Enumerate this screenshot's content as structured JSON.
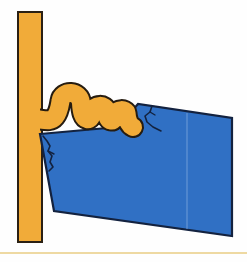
{
  "figure": {
    "colors": {
      "background": "#fefefe",
      "bar_fill": "#f1ab39",
      "bar_outline": "#2a2014",
      "ribbon_fill": "#f1ab39",
      "ribbon_outline": "#261c10",
      "block_fill": "#3070c4",
      "block_outline": "#13223f",
      "crack_color": "#13223f",
      "crease_color": "#7aa5dc",
      "divider_color": "#eed9a2"
    },
    "shapes": {
      "wall_bar": {
        "x": "18",
        "y": "12",
        "width": "24",
        "height": "230"
      },
      "tilted_block": {
        "points": "40,134 118,127 138,104 232,118 232,236 54,211"
      },
      "block_crease": {
        "x1": "187",
        "y1": "113",
        "x2": "187",
        "y2": "229"
      },
      "folded_ribbon": {
        "d": "M 36 119 C 45 120 51 122 55 117 C 59 112 59.5 107 60.5 101 C 62 90 80 90 81 103 C 81.5 112 83 118 87 119 C 90.5 120 91.5 116 92.5 112 C 93.5 104 106 104 106.5 111 C 107 117 108.5 120 111 120.5 C 114 121 114.5 118 115.5 114 C 116.5 109 126 109 126.5 113 C 127 120 129 125 133 127"
      },
      "crack_left_main": {
        "d": "M 43 136 L 47 141 L 50 146 L 48 151 L 52 156 L 50 162 L 53 167 L 49 171"
      },
      "crack_left_branch": {
        "d": "M 48 151 L 54 154"
      },
      "crack_right_main": {
        "d": "M 152 106 L 150 112 L 145 116 L 147 122 L 153 127 L 161 131"
      },
      "crack_right_branch": {
        "d": "M 150 112 L 155 115"
      },
      "junction_patch": {
        "x": "20",
        "y": "106",
        "width": "20",
        "height": "26"
      },
      "page_divider": {
        "x": "0",
        "y": "252",
        "width": "247",
        "height": "2"
      }
    }
  }
}
